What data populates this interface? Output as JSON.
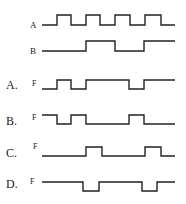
{
  "diagram": {
    "type": "timing-diagram",
    "inputs": [
      {
        "name": "A",
        "label": "A",
        "label_y": 28,
        "low_y": 25,
        "high_y": 15,
        "points": [
          [
            42,
            "L"
          ],
          [
            57,
            "H"
          ],
          [
            71,
            "L"
          ],
          [
            86,
            "H"
          ],
          [
            100,
            "L"
          ],
          [
            115,
            "H"
          ],
          [
            130,
            "L"
          ],
          [
            145,
            "H"
          ],
          [
            161,
            "L"
          ],
          [
            175,
            "L"
          ]
        ]
      },
      {
        "name": "B",
        "label": "B",
        "label_y": 54,
        "low_y": 51,
        "high_y": 41,
        "points": [
          [
            42,
            "L"
          ],
          [
            86,
            "H"
          ],
          [
            115,
            "L"
          ],
          [
            144,
            "H"
          ],
          [
            175,
            "H"
          ]
        ]
      }
    ],
    "options": [
      {
        "option": "A.",
        "signal": "F",
        "label_y": 88,
        "low_y": 89,
        "high_y": 80,
        "points": [
          [
            42,
            "L"
          ],
          [
            57,
            "H"
          ],
          [
            71,
            "L"
          ],
          [
            86,
            "H"
          ],
          [
            129,
            "L"
          ],
          [
            144,
            "H"
          ],
          [
            175,
            "H"
          ]
        ]
      },
      {
        "option": "B.",
        "signal": "F",
        "label_y": 124,
        "low_y": 124,
        "high_y": 115,
        "points": [
          [
            42,
            "H"
          ],
          [
            57,
            "L"
          ],
          [
            71,
            "H"
          ],
          [
            86,
            "L"
          ],
          [
            129,
            "H"
          ],
          [
            144,
            "L"
          ],
          [
            175,
            "L"
          ]
        ]
      },
      {
        "option": "C.",
        "signal": "F",
        "label_y": 158,
        "low_y": 156,
        "high_y": 147,
        "points": [
          [
            42,
            "L"
          ],
          [
            86,
            "H"
          ],
          [
            102,
            "L"
          ],
          [
            145,
            "H"
          ],
          [
            161,
            "L"
          ],
          [
            175,
            "L"
          ]
        ]
      },
      {
        "option": "D.",
        "signal": "F",
        "label_y": 188,
        "low_y": 191,
        "high_y": 182,
        "points": [
          [
            42,
            "H"
          ],
          [
            83,
            "L"
          ],
          [
            99,
            "H"
          ],
          [
            142,
            "L"
          ],
          [
            157,
            "H"
          ],
          [
            175,
            "H"
          ]
        ]
      }
    ]
  }
}
